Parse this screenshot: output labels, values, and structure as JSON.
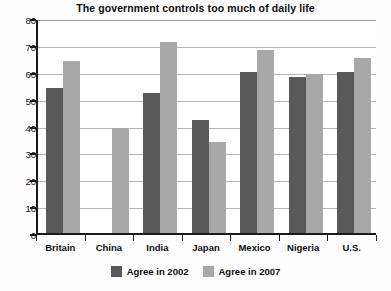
{
  "chart_data": {
    "type": "bar",
    "title": "The government controls too much of daily life",
    "xlabel": "",
    "ylabel": "",
    "ylim": [
      0,
      80
    ],
    "yticks": [
      0,
      10,
      20,
      30,
      40,
      50,
      60,
      70,
      80
    ],
    "grid": true,
    "legend_position": "bottom",
    "categories": [
      "Britain",
      "China",
      "India",
      "Japan",
      "Mexico",
      "Nigeria",
      "U.S."
    ],
    "series": [
      {
        "name": "Agree in 2002",
        "color": "#595959",
        "values": [
          54,
          null,
          52,
          42,
          60,
          58,
          60
        ]
      },
      {
        "name": "Agree in 2007",
        "color": "#a8a8a8",
        "values": [
          64,
          39,
          71,
          34,
          68,
          59,
          65
        ]
      }
    ]
  }
}
